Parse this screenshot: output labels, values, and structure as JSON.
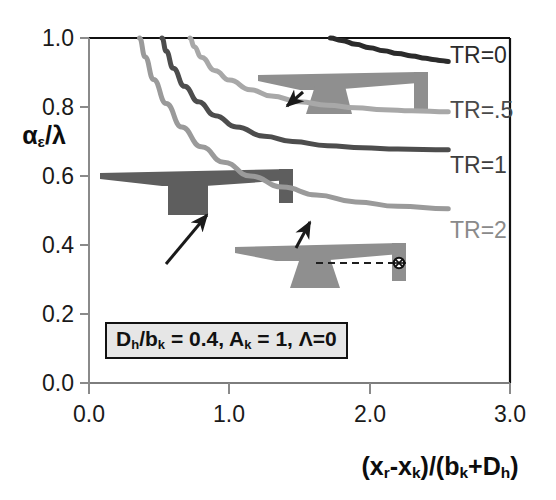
{
  "chart_data": {
    "type": "line",
    "title": "",
    "xlabel": "(x_r-x_k)/(b_k+D_h)",
    "ylabel": "alpha_epsilon/lambda",
    "xlim": [
      0.0,
      3.0
    ],
    "ylim": [
      0.0,
      1.0
    ],
    "grid": false,
    "legend_position": "right-inline-at-curve-end",
    "xticks": [
      "0.0",
      "1.0",
      "2.0",
      "3.0"
    ],
    "xtick_values": [
      0.0,
      1.0,
      2.0,
      3.0
    ],
    "yticks": [
      "0.0",
      "0.2",
      "0.4",
      "0.6",
      "0.8",
      "1.0"
    ],
    "ytick_values": [
      0.0,
      0.2,
      0.4,
      0.6,
      0.8,
      1.0
    ],
    "annotation": "D_h/b_k = 0.4, A_k = 1, Λ=0",
    "series": [
      {
        "name": "TR=0",
        "label": "TR=0",
        "color": "#2b2b2b",
        "asymptote": 0.93,
        "x": [
          1.72,
          1.8,
          1.9,
          2.0,
          2.1,
          2.2,
          2.3,
          2.4,
          2.45,
          2.5,
          2.56
        ],
        "y": [
          1.0,
          0.993,
          0.982,
          0.972,
          0.963,
          0.955,
          0.948,
          0.941,
          0.938,
          0.935,
          0.932
        ]
      },
      {
        "name": "TR=.5",
        "label": "TR=.5",
        "color": "#a8a8a8",
        "asymptote": 0.785,
        "x": [
          0.72,
          0.75,
          0.8,
          0.9,
          1.0,
          1.15,
          1.3,
          1.5,
          1.7,
          1.9,
          2.1,
          2.3,
          2.56
        ],
        "y": [
          1.0,
          0.975,
          0.944,
          0.905,
          0.878,
          0.85,
          0.832,
          0.815,
          0.805,
          0.798,
          0.792,
          0.789,
          0.786
        ]
      },
      {
        "name": "TR=1",
        "label": "TR=1",
        "color": "#4d4d4d",
        "asymptote": 0.675,
        "x": [
          0.52,
          0.55,
          0.6,
          0.68,
          0.78,
          0.9,
          1.05,
          1.25,
          1.45,
          1.7,
          1.95,
          2.2,
          2.56
        ],
        "y": [
          1.0,
          0.962,
          0.912,
          0.86,
          0.815,
          0.775,
          0.742,
          0.715,
          0.7,
          0.688,
          0.682,
          0.678,
          0.676
        ]
      },
      {
        "name": "TR=2",
        "label": "TR=2",
        "color": "#9a9a9a",
        "asymptote": 0.505,
        "x": [
          0.36,
          0.4,
          0.46,
          0.55,
          0.66,
          0.8,
          0.96,
          1.15,
          1.38,
          1.62,
          1.9,
          2.2,
          2.56
        ],
        "y": [
          1.0,
          0.945,
          0.88,
          0.81,
          0.742,
          0.685,
          0.64,
          0.6,
          0.568,
          0.545,
          0.525,
          0.512,
          0.505
        ]
      }
    ],
    "annotations": [
      {
        "name": "arrow-to-tr1",
        "type": "arrow",
        "from": [
          0.55,
          0.635
        ],
        "to": [
          0.84,
          0.775
        ]
      },
      {
        "name": "arrow-to-tr05",
        "type": "arrow",
        "from": [
          1.53,
          0.845
        ],
        "to": [
          1.4,
          0.805
        ]
      },
      {
        "name": "arrow-to-tr2",
        "type": "arrow",
        "from": [
          1.48,
          0.415
        ],
        "to": [
          1.57,
          0.49
        ]
      }
    ],
    "inset_icons": [
      {
        "name": "aircraft-planform-tapered-tail",
        "tail_taper": "tapered",
        "position": [
          1.05,
          0.86
        ]
      },
      {
        "name": "aircraft-planform-rect-tail",
        "tail_taper": "rectangular",
        "position": [
          0.1,
          0.59
        ]
      },
      {
        "name": "aircraft-planform-target-marker",
        "tail_taper": "tapered",
        "marker": "crosshair",
        "position": [
          0.95,
          0.355
        ]
      }
    ]
  },
  "axis": {
    "ylabel_alpha": "α",
    "ylabel_eps": "ε",
    "ylabel_tail": "/λ",
    "xlabel_text": "(x_r-x_k)/(b_k+D_h)"
  }
}
